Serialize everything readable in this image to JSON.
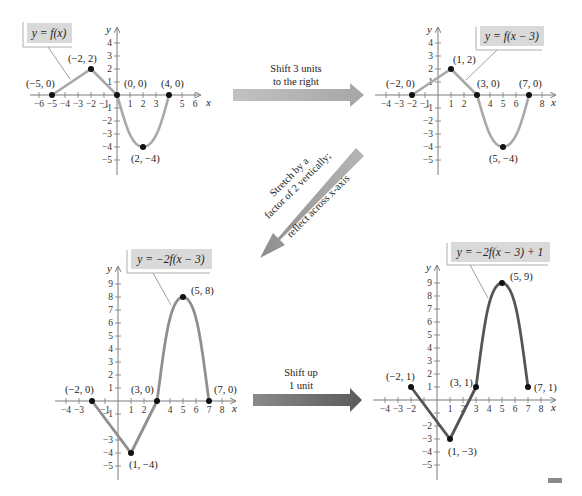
{
  "colors": {
    "curve_light": "#a9a9a9",
    "curve_dark": "#555555",
    "axis": "#7a7a7a",
    "point": "#111111",
    "label_box": "#d9d9d9",
    "arrow_light": "#b9b9b9",
    "arrow_dark": "#6a6a6a"
  },
  "graphs": [
    {
      "id": "graph-1",
      "equation": "y = f(x)",
      "points": [
        {
          "label": "(−5, 0)"
        },
        {
          "label": "(−2, 2)"
        },
        {
          "label": "(0, 0)"
        },
        {
          "label": "(4, 0)"
        },
        {
          "label": "(2, −4)"
        }
      ],
      "x_ticks": [
        "−6",
        "−5",
        "−4",
        "−3",
        "−2",
        "−1",
        "1",
        "2",
        "3",
        "5",
        "6"
      ],
      "y_ticks": [
        "4",
        "3",
        "2",
        "1",
        "−1",
        "−2",
        "−3",
        "−4",
        "−5"
      ],
      "x_axis_label": "x",
      "y_axis_label": "y"
    },
    {
      "id": "graph-2",
      "equation": "y = f(x − 3)",
      "points": [
        {
          "label": "(−2, 0)"
        },
        {
          "label": "(1, 2)"
        },
        {
          "label": "(3, 0)"
        },
        {
          "label": "(7, 0)"
        },
        {
          "label": "(5, −4)"
        }
      ],
      "x_ticks": [
        "−4",
        "−3",
        "−2",
        "−1",
        "1",
        "2",
        "4",
        "5",
        "6",
        "8"
      ],
      "y_ticks": [
        "4",
        "3",
        "2",
        "1",
        "−1",
        "−2",
        "−3",
        "−4",
        "−5"
      ],
      "x_axis_label": "x",
      "y_axis_label": "y"
    },
    {
      "id": "graph-3",
      "equation": "y = −2f(x − 3)",
      "points": [
        {
          "label": "(−2, 0)"
        },
        {
          "label": "(1, −4)"
        },
        {
          "label": "(3, 0)"
        },
        {
          "label": "(5, 8)"
        },
        {
          "label": "(7, 0)"
        }
      ],
      "x_ticks": [
        "−4",
        "−3",
        "−1",
        "1",
        "2",
        "4",
        "5",
        "6",
        "7",
        "8"
      ],
      "y_ticks": [
        "9",
        "8",
        "7",
        "6",
        "5",
        "4",
        "3",
        "2",
        "1",
        "−1",
        "−3",
        "−4",
        "−5"
      ],
      "x_axis_label": "x",
      "y_axis_label": "y"
    },
    {
      "id": "graph-4",
      "equation": "y = −2f(x − 3) + 1",
      "points": [
        {
          "label": "(−2, 1)"
        },
        {
          "label": "(1, −3)"
        },
        {
          "label": "(3, 1)"
        },
        {
          "label": "(5, 9)"
        },
        {
          "label": "(7, 1)"
        }
      ],
      "x_ticks": [
        "−4",
        "−3",
        "−2",
        "1",
        "2",
        "3",
        "4",
        "5",
        "6",
        "7",
        "8"
      ],
      "y_ticks": [
        "9",
        "8",
        "7",
        "6",
        "5",
        "4",
        "3",
        "2",
        "1",
        "−2",
        "−3",
        "−4",
        "−5"
      ],
      "x_axis_label": "x",
      "y_axis_label": "y"
    }
  ],
  "transforms": [
    {
      "id": "shift-right",
      "line1": "Shift 3 units",
      "line2": "to the right"
    },
    {
      "id": "stretch-reflect",
      "line1": "Stretch by a",
      "line2": "factor of 2 vertically;",
      "line3": "reflect across x-axis"
    },
    {
      "id": "shift-up",
      "line1": "Shift up",
      "line2": "1 unit"
    }
  ]
}
